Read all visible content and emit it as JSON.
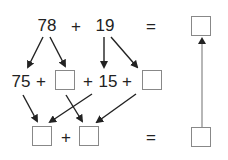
{
  "top_row": {
    "a": "78",
    "op": "+",
    "b": "19",
    "eq": "="
  },
  "middle_row": {
    "a_part": "75",
    "op1": "+",
    "op2": "+",
    "b_part": "15",
    "op3": "+"
  },
  "bottom_row": {
    "op": "+",
    "eq": "="
  },
  "colors": {
    "text": "#222222",
    "arrow": "#222222",
    "box_border": "#888888",
    "vertical_line": "#999999"
  }
}
